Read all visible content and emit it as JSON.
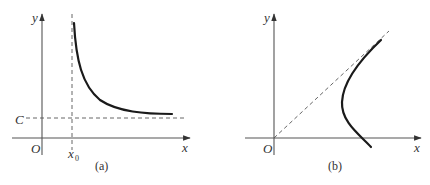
{
  "panels": [
    {
      "caption": "(a)",
      "axis_x_label": "x",
      "axis_y_label": "y",
      "origin_label": "O",
      "vertical_asymptote_label": "x",
      "vertical_asymptote_sub": "0",
      "horizontal_asymptote_label": "C",
      "description": "Decreasing curve with vertical asymptote x = x0 and horizontal asymptote y = C"
    },
    {
      "caption": "(b)",
      "axis_x_label": "x",
      "axis_y_label": "y",
      "origin_label": "O",
      "description": "Hyperbola-like branch opening left with oblique asymptote through origin"
    }
  ],
  "colors": {
    "axis": "#555555",
    "curve": "#1a1a1a",
    "text": "#333333"
  }
}
